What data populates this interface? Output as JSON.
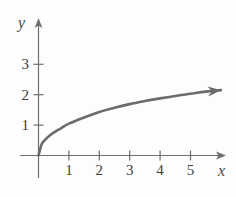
{
  "chart_data": {
    "type": "line",
    "title": "",
    "subtitle": "",
    "xlabel": "x",
    "ylabel": "y",
    "xlim": [
      0,
      6.2
    ],
    "ylim": [
      0,
      3.9
    ],
    "grid": false,
    "legend": null,
    "annotations": [],
    "x_ticks": [
      {
        "value": 1,
        "label": "1"
      },
      {
        "value": 2,
        "label": "2"
      },
      {
        "value": 3,
        "label": "3"
      },
      {
        "value": 4,
        "label": "4"
      },
      {
        "value": 5,
        "label": "5"
      }
    ],
    "y_ticks": [
      {
        "value": 1,
        "label": "1"
      },
      {
        "value": 2,
        "label": "2"
      },
      {
        "value": 3,
        "label": "3"
      }
    ],
    "series": [
      {
        "name": "curve",
        "style": "solid",
        "color": "#6b6b6b",
        "width": 2.6,
        "arrow_end": true,
        "x": [
          0,
          0.1,
          0.2,
          0.35,
          0.5,
          0.75,
          1,
          1.5,
          2,
          2.5,
          3,
          3.5,
          4,
          4.5,
          5,
          5.5,
          6
        ],
        "y": [
          0,
          0.36,
          0.5,
          0.64,
          0.75,
          0.9,
          1.05,
          1.25,
          1.43,
          1.57,
          1.69,
          1.79,
          1.88,
          1.96,
          2.03,
          2.1,
          2.15
        ]
      }
    ],
    "axis_color": "#6f6f6f",
    "tick_color": "#6f6f6f",
    "curve_color": "#6b6b6b",
    "background": "#fdfdfd"
  }
}
